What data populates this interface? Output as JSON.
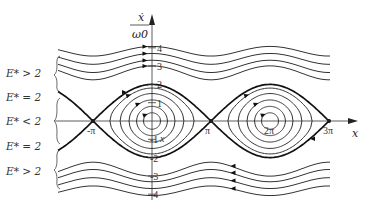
{
  "figure": {
    "axes": {
      "x_label": "x",
      "y_label_numerator": "ẋ",
      "y_label_denominator": "ω0",
      "x_ticks": [
        {
          "value_pi": -1,
          "label": "-π"
        },
        {
          "value_pi": 1,
          "label": "π"
        },
        {
          "value_pi": 2,
          "label": "2π"
        },
        {
          "value_pi": 3,
          "label": "3π"
        }
      ],
      "y_ticks": [
        {
          "value": 4,
          "label": "4"
        },
        {
          "value": 3,
          "label": "3"
        },
        {
          "value": 2,
          "label": "2"
        },
        {
          "value": 1,
          "label": "1"
        },
        {
          "value": -1,
          "label": "-1"
        },
        {
          "value": -2,
          "label": "-2"
        },
        {
          "value": -3,
          "label": "-3"
        },
        {
          "value": -4,
          "label": "-4"
        }
      ],
      "x_range_pi": [
        -1.2,
        3
      ],
      "y_range": [
        -4.2,
        4.3
      ]
    },
    "region_labels": [
      {
        "label": "E* > 2",
        "region": "upper-rotation"
      },
      {
        "label": "E* =  2",
        "region": "upper-separatrix"
      },
      {
        "label": "E* < 2",
        "region": "libration"
      },
      {
        "label": "E* =  2",
        "region": "lower-separatrix"
      },
      {
        "label": "E* > 2",
        "region": "lower-rotation"
      }
    ],
    "separatrix_peak": 2,
    "libration_amplitudes": [
      0.45,
      0.8,
      1.15,
      1.5,
      1.8
    ],
    "rotation_minimums": [
      2.25,
      2.65,
      3.1,
      3.55
    ]
  }
}
